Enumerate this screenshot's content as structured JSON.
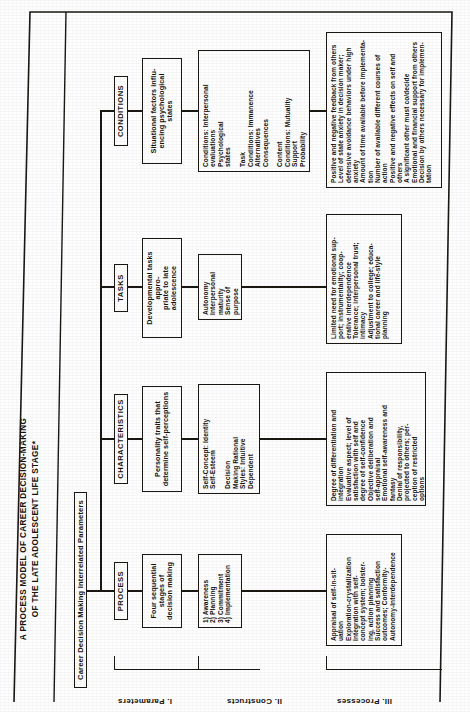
{
  "figure": {
    "title": "A PROCESS MODEL OF CAREER DECISION-MAKING\nOF THE LATE ADOLESCENT LIFE STAGE*",
    "root_label": "Career Decision Making Interrelated Parameters",
    "row_labels": [
      "I.  Parameters",
      "II.  Constructs",
      "III.  Processes"
    ],
    "columns": [
      {
        "key": "process",
        "header": "PROCESS",
        "construct": "Four sequential\nstages of\ndecision making",
        "detail": "1)  Awareness\n2)  Planning\n3)  Commitment\n4)  Implementation",
        "processes": "Appraisal of self-in-sit-\nuation\nExploration-crystallization\nIntegration with self-\nconcept system; bolster-\ning, action planning\nSuccess and satisfaction\noutcomes; Conformity-\nAutonomy-Interdependence"
      },
      {
        "key": "characteristics",
        "header": "CHARACTERISTICS",
        "construct": "Personality traits that\ndetermine self-perceptions",
        "detail": "Self-Concept:      Identity\n                            Self-Esteem\n\nDecision\nMaking                 Rational\nStyles:                  Intuitive\n                            Dependent",
        "processes": "Degree of differentiation and\nintegration\nEvaluative aspect; level of\nsatisfaction with self and\ndegree of self-confidence\nObjective deliberation and\nself-appraisal\nEmotional self-awareness and\nfantasy\nDenial of responsibility,\nprojected to others; per-\nception of restricted\noptions"
      },
      {
        "key": "tasks",
        "header": "TASKS",
        "construct": "Developmental tasks appro-\npriate to late adolescence",
        "detail": "Autonomy\nInterpersonal\n    maturity\nSense of\n    purpose",
        "processes": "Limited need for emotional sup-\nport; instrumentality; coop-\nerative interdependence\nTolerance; interpersonal trust;\n     intimacy\nAdjustment to college; educa-\ntional career and life-style\nplanning"
      },
      {
        "key": "conditions",
        "header": "CONDITIONS",
        "construct": "Situational factors influ-\nencing psychological states",
        "detail": "Conditions:  Interpersonal\n                     evaluations\n                     Psychological\n                     states\n\nTask\nConditions:  Immanence\n                     Alternatives\n                     Consequences\n\nContent\nConditions:  Mutuality\n                     Support\n                     Probability",
        "processes": "Positive and negative feedback from others\nLevel of state anxiety in decision maker;\ndefensive avoidance behaviors under high\nanxiety\nAmount of time available before implementa-\ntion\nNumber of available different courses of\naction\nPositive and negative effects on self and\nothers\nA significant other must co/decide\nEmotional and financial support from others\nDecision by others necessary for implemen-\ntation"
      }
    ]
  },
  "colors": {
    "ink": "#1b1813",
    "paper": "#fefefe"
  }
}
